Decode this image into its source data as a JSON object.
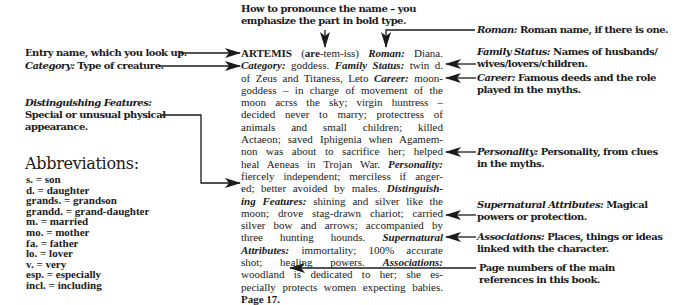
{
  "callouts": {
    "pronounce": {
      "line1": "How to pronounce the name – you",
      "line2": "emphasize the part in bold type."
    },
    "entry_name": {
      "text": "Entry name, which you look up."
    },
    "category": {
      "label": "Category:",
      "text": " Type of creature."
    },
    "distinguishing": {
      "label": "Distinguishing Features:",
      "line1": "Special or unusual physical",
      "line2": "appearance."
    },
    "roman": {
      "label": "Roman:",
      "text": " Roman name, if there is one."
    },
    "family_status": {
      "label": "Family Status:",
      "line1": " Names of husbands/",
      "line2": "wives/lovers/children."
    },
    "career": {
      "label": "Career:",
      "line1": " Famous deeds and the role",
      "line2": "played in the myths."
    },
    "personality": {
      "label": "Personality:",
      "line1": " Personality, from clues",
      "line2": "in the myths."
    },
    "supernatural": {
      "label": "Supernatural Attributes:",
      "line1": " Magical",
      "line2": "powers or protection."
    },
    "associations": {
      "label": "Associations:",
      "line1": " Places, things or ideas",
      "line2": "linked with the character."
    },
    "page_numbers": {
      "line1": "Page numbers of the main",
      "line2": "references in this book."
    }
  },
  "entry": {
    "name": "ARTEMIS",
    "pron_open": " (",
    "pron_bold": "are",
    "pron_rest": "-tem-iss) ",
    "roman_label": "Roman:",
    "roman_value": " Diana.",
    "category_label": "Category:",
    "category_value": " goddess. ",
    "family_label": "Family Status:",
    "family_value_1": " twin d.",
    "line3_text": "of Zeus and Titaness, Leto ",
    "career_label": "Career:",
    "career_value_1": " moon-",
    "line4": "goddess – in charge of movement of the",
    "line5": "moon acrss the sky; virgin huntress –",
    "line6": "decided never to marry; protectress of",
    "line7": "animals and small children; killed",
    "line8": "Actaeon; saved Iphigenia when Agamem-",
    "line9": "non was about to sacrifice her; helped",
    "line10_text": "heal Aeneas in Trojan War. ",
    "personality_label": "Personality:",
    "line11": "fiercely independent; merciless if anger-",
    "line12_text": "ed; better avoided by males. ",
    "dist_label_1": "Distinguish-",
    "dist_label_2": "ing Features:",
    "line13_text": " shining and silver like the",
    "line14": "moon; drove stag-drawn chariot; carried",
    "line15": "silver bow and arrows; accompanied by",
    "line16_text": "three hunting hounds. ",
    "super_label_1": "Supernatural",
    "super_label_2": "Attributes:",
    "line17_text": " immortality; 100% accurate",
    "line18_text": "shot; healing powers. ",
    "assoc_label": "Associations:",
    "line19": "woodland is dedicated to her; she es-",
    "line20": "pecially protects women expecting babies.",
    "page": "Page 17."
  },
  "abbreviations": {
    "title": "Abbreviations:",
    "items": [
      "s. = son",
      "d. = daughter",
      "grands. = grandson",
      "grandd. = grand-daughter",
      "m. = married",
      "mo. = mother",
      "fa. = father",
      "lo. = lover",
      "v. = very",
      "esp. = especially",
      "incl. = including"
    ]
  }
}
